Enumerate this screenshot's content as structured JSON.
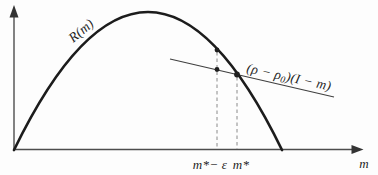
{
  "style": {
    "background": "#fdfdfd",
    "ink": "#1f1f1f",
    "axis_color": "#4d4d4d",
    "arrow_color": "#333333",
    "curve_color": "#1c1c1c",
    "secant_color": "#3f3f3f",
    "dash_color": "#8a8a8a"
  },
  "labels": {
    "curve": "R(m)",
    "secant_pre": "(ρ − ρ",
    "secant_sub": "0",
    "secant_post": ")(I − m)",
    "tick_left": "m*− ε",
    "tick_right": "m*",
    "x_axis": "m"
  },
  "paths": {
    "y_axis": "M 14 150 L 14 15",
    "y_axis_arrow": "M 14 5 L 9.5 17.5 L 18.5 17.5 Z",
    "x_axis": "M 14 149.5 L 354 149.5",
    "x_axis_arrow": "M 363.5 149.5 L 351.5 145 L 351.5 154 Z",
    "curve": "M 14 150 Q 148 -126 282 150",
    "secant": "M 170 59 L 334 97",
    "dropline_left": "M 217 52 L 217 149",
    "dropline_right": "M 237 77 L 237 149"
  },
  "points": {
    "curve_dot": {
      "cx": 217,
      "cy": 50,
      "r": 2.4
    },
    "line_dot": {
      "cx": 217,
      "cy": 69.5,
      "r": 2.4
    },
    "intersection_dot": {
      "cx": 237,
      "cy": 74.5,
      "r": 2.9
    }
  },
  "chart_data": {
    "type": "line",
    "title": "",
    "xlabel": "m",
    "ylabel": "",
    "axes_numeric": false,
    "grid": false,
    "legend": "none",
    "x_range_norm": [
      0,
      1
    ],
    "y_range_norm": [
      0,
      1
    ],
    "series": [
      {
        "name": "R(m)",
        "style": "thick concave hump curve from origin back to x-axis",
        "x_norm": [
          0,
          0.077,
          0.154,
          0.23,
          0.307,
          0.384,
          0.461,
          0.538,
          0.582,
          0.614,
          0.639,
          0.691,
          0.768
        ],
        "y_norm": [
          0,
          0.355,
          0.631,
          0.828,
          0.946,
          0.986,
          0.946,
          0.828,
          0.714,
          0.631,
          0.539,
          0.355,
          0
        ]
      },
      {
        "name": "(ρ − ρ0)(I − m)",
        "style": "thin straight line with negative slope crossing the curve",
        "x_norm": [
          0.447,
          0.917
        ],
        "y_norm": [
          0.65,
          0.379
        ]
      }
    ],
    "annotations": {
      "x_marks": [
        {
          "label": "m*− ε",
          "x_norm": 0.582
        },
        {
          "label": "m*",
          "x_norm": 0.639
        }
      ],
      "marked_points": [
        {
          "x_norm": 0.582,
          "y_norm": 0.714,
          "on": "R(m) curve"
        },
        {
          "x_norm": 0.582,
          "y_norm": 0.575,
          "on": "secant line"
        },
        {
          "x_norm": 0.639,
          "y_norm": 0.539,
          "on": "intersection of R(m) and secant line"
        }
      ],
      "droplines": "dashed vertical lines from the marked points down to the x-axis at m*−ε and m*"
    }
  }
}
